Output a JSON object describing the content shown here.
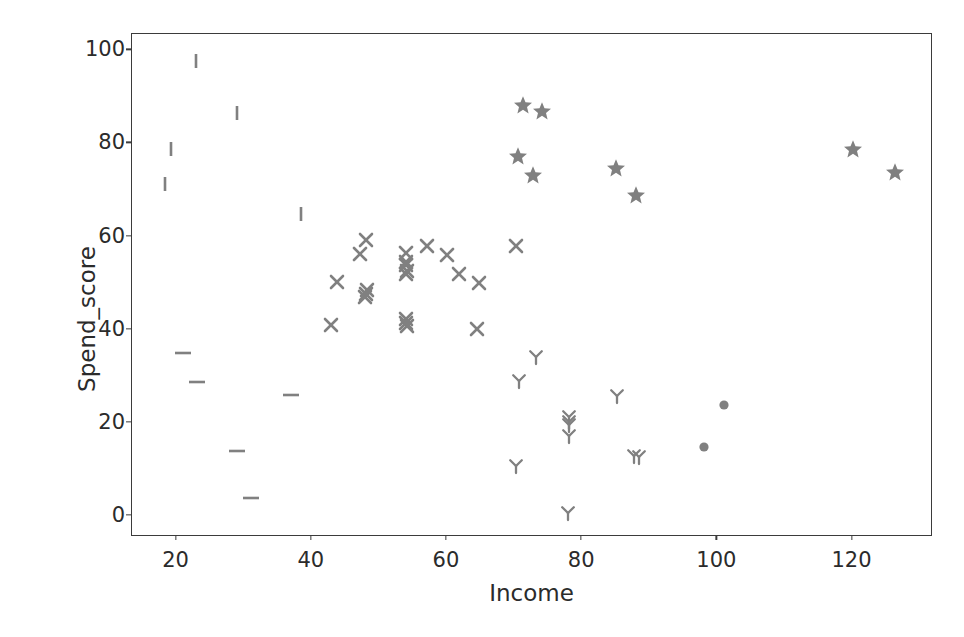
{
  "chart": {
    "title": "",
    "xlabel": "Income",
    "ylabel": "Spend_score",
    "xticks": [
      "20",
      "40",
      "60",
      "80",
      "100",
      "120"
    ],
    "yticks": [
      "0",
      "20",
      "40",
      "60",
      "80",
      "100"
    ],
    "marker_color": "#808080"
  },
  "chart_data": {
    "type": "scatter",
    "title": "",
    "xlabel": "Income",
    "ylabel": "Spend_score",
    "xlim": [
      13.4,
      131.9
    ],
    "ylim": [
      -4.5,
      103.5
    ],
    "xticks": [
      20,
      40,
      60,
      80,
      100,
      120
    ],
    "yticks": [
      0,
      20,
      40,
      60,
      80,
      100
    ],
    "grid": false,
    "legend": "none",
    "color": "#808080",
    "series": [
      {
        "name": "cluster-vline",
        "marker": "vline",
        "points": [
          [
            22.8,
            97.8
          ],
          [
            28.9,
            86.5
          ],
          [
            19.2,
            78.8
          ],
          [
            18.3,
            71.2
          ],
          [
            38.4,
            64.8
          ]
        ]
      },
      {
        "name": "cluster-hline",
        "marker": "hline",
        "points": [
          [
            21.0,
            35.0
          ],
          [
            23.0,
            28.8
          ],
          [
            36.9,
            26.0
          ],
          [
            29.0,
            13.9
          ],
          [
            31.0,
            3.8
          ]
        ]
      },
      {
        "name": "cluster-x",
        "marker": "x",
        "points": [
          [
            48.0,
            59.2
          ],
          [
            47.2,
            56.2
          ],
          [
            43.8,
            50.3
          ],
          [
            48.2,
            48.6
          ],
          [
            48.0,
            47.6
          ],
          [
            47.9,
            47.0
          ],
          [
            42.9,
            41.1
          ],
          [
            54.0,
            56.5
          ],
          [
            53.9,
            54.6
          ],
          [
            54.0,
            53.9
          ],
          [
            54.1,
            52.7
          ],
          [
            53.9,
            52.0
          ],
          [
            57.1,
            57.9
          ],
          [
            54.0,
            42.3
          ],
          [
            54.0,
            41.5
          ],
          [
            54.1,
            40.9
          ],
          [
            60.0,
            56.0
          ],
          [
            61.8,
            52.0
          ],
          [
            64.8,
            50.0
          ],
          [
            64.5,
            40.1
          ],
          [
            70.2,
            58.0
          ]
        ]
      },
      {
        "name": "cluster-star",
        "marker": "star",
        "points": [
          [
            71.3,
            88.2
          ],
          [
            74.1,
            87.0
          ],
          [
            70.5,
            77.2
          ],
          [
            72.7,
            73.3
          ],
          [
            85.0,
            74.8
          ],
          [
            88.0,
            68.9
          ],
          [
            120.0,
            78.8
          ],
          [
            126.3,
            73.8
          ]
        ]
      },
      {
        "name": "cluster-y",
        "marker": "tri_down_y",
        "points": [
          [
            73.1,
            34.1
          ],
          [
            70.6,
            29.0
          ],
          [
            78.0,
            21.3
          ],
          [
            78.0,
            20.2
          ],
          [
            78.1,
            19.6
          ],
          [
            78.0,
            17.1
          ],
          [
            85.1,
            25.7
          ],
          [
            87.6,
            12.8
          ],
          [
            88.4,
            12.6
          ],
          [
            70.2,
            10.8
          ],
          [
            77.9,
            0.6
          ]
        ]
      },
      {
        "name": "cluster-circle",
        "marker": "circle",
        "points": [
          [
            101.0,
            23.9
          ],
          [
            98.0,
            14.8
          ]
        ]
      }
    ]
  }
}
